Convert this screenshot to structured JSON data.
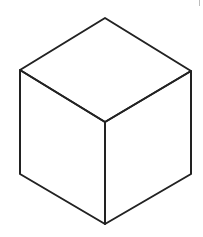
{
  "diagram": {
    "type": "isometric-cube",
    "stroke_color": "#222222",
    "background": "#ffffff",
    "stroke_width": 2,
    "vertices": {
      "top": [
        105,
        18
      ],
      "left_top": [
        20,
        70
      ],
      "right_top": [
        191,
        71
      ],
      "center": [
        105,
        122
      ],
      "left_bottom": [
        20,
        174
      ],
      "right_bottom": [
        191,
        174
      ],
      "bottom": [
        105,
        224
      ]
    }
  }
}
